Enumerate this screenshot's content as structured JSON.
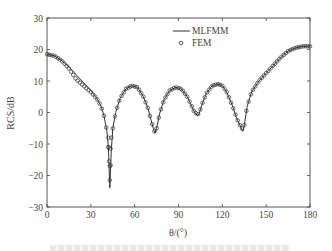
{
  "chart_data": {
    "type": "line",
    "title": "",
    "xlabel": "θ/(°)",
    "ylabel": "RCS/dB",
    "xlim": [
      0,
      180
    ],
    "ylim": [
      -30,
      30
    ],
    "xticks": [
      0,
      30,
      60,
      90,
      120,
      150,
      180
    ],
    "yticks": [
      -30,
      -20,
      -10,
      0,
      10,
      20,
      30
    ],
    "grid": false,
    "legend_position": "upper center-right",
    "series": [
      {
        "name": "MLFMM",
        "style": "solid-line",
        "x": [
          0,
          5,
          10,
          15,
          20,
          25,
          30,
          34,
          37,
          39,
          41,
          42,
          43,
          44,
          45,
          47,
          50,
          54,
          58,
          62,
          66,
          69,
          71,
          73,
          74,
          75,
          77,
          80,
          84,
          88,
          92,
          96,
          99,
          101,
          103,
          104,
          106,
          109,
          113,
          117,
          120,
          123,
          127,
          130,
          132,
          134,
          135,
          137,
          140,
          145,
          150,
          155,
          160,
          165,
          170,
          175,
          180
        ],
        "values": [
          18.5,
          18,
          16.5,
          14.5,
          12,
          9.5,
          7,
          4.5,
          2,
          -1,
          -6,
          -11,
          -24,
          -12,
          -5,
          0,
          4.5,
          7.5,
          8.5,
          8,
          5,
          1.5,
          -2,
          -5.5,
          -6.5,
          -5,
          -0.5,
          4,
          7,
          8,
          7.5,
          5,
          2,
          0,
          -1,
          -0.5,
          2.5,
          6,
          8.5,
          9,
          8.5,
          6.5,
          2,
          -2,
          -4,
          -6,
          -4,
          2,
          6.5,
          10,
          12.5,
          15,
          17.5,
          19.5,
          20.5,
          21,
          21
        ]
      },
      {
        "name": "FEM",
        "style": "open-circle-marker",
        "x": [
          0,
          5,
          10,
          15,
          20,
          25,
          30,
          34,
          37,
          39,
          41,
          42,
          43,
          44,
          45,
          47,
          50,
          54,
          58,
          62,
          66,
          69,
          71,
          73,
          74,
          75,
          77,
          80,
          84,
          88,
          92,
          96,
          99,
          101,
          103,
          104,
          106,
          109,
          113,
          117,
          120,
          123,
          127,
          130,
          132,
          134,
          135,
          137,
          140,
          145,
          150,
          155,
          160,
          165,
          170,
          175,
          180
        ],
        "values": [
          18.5,
          18,
          16.5,
          14,
          10.5,
          8.5,
          6.5,
          4.5,
          2,
          -1,
          -6,
          -11,
          -21.5,
          -12,
          -5,
          0,
          4.5,
          7.5,
          8.5,
          8,
          5,
          1.5,
          -2,
          -5.5,
          -6.5,
          -5,
          -0.5,
          4,
          7,
          8,
          7.5,
          5,
          2,
          0,
          -0.5,
          -0.5,
          2.5,
          6,
          8.5,
          9,
          8.5,
          6.5,
          2,
          -2,
          -4,
          -5.5,
          -4,
          2,
          6.5,
          10,
          12.5,
          15,
          17.5,
          19.5,
          20.5,
          21,
          21
        ]
      }
    ]
  },
  "axes": {
    "x_label": "θ/(°)",
    "y_label": "RCS/dB",
    "x_ticks": [
      "0",
      "30",
      "60",
      "90",
      "120",
      "150",
      "180"
    ],
    "y_ticks": [
      "30",
      "20",
      "10",
      "0",
      "−10",
      "−20",
      "−30"
    ]
  },
  "legend": {
    "items": [
      {
        "label": "MLFMM",
        "marker": "line"
      },
      {
        "label": "FEM",
        "marker": "circle"
      }
    ]
  },
  "colors": {
    "line": "#333333",
    "marker": "#333333",
    "axis": "#444444"
  }
}
